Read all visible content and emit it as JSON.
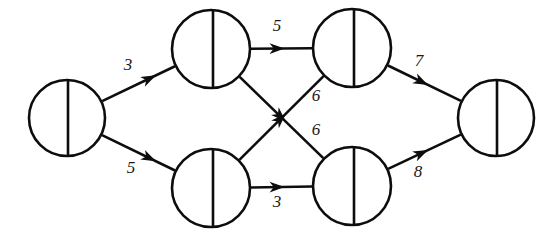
{
  "diagram": {
    "type": "flow-network",
    "title": "",
    "background_color": "#ffffff",
    "stroke_color": "#0d0d0d",
    "node_fill": "#ffffff",
    "node_style": "circle-with-vertical-divider",
    "nodes": [
      {
        "id": "source",
        "label": "",
        "cx": 67,
        "cy": 118,
        "r": 38,
        "divider_x": 68,
        "name": "node-source"
      },
      {
        "id": "a",
        "label": "",
        "cx": 211,
        "cy": 49,
        "r": 39,
        "divider_x": 213,
        "name": "node-top-left"
      },
      {
        "id": "b",
        "label": "",
        "cx": 211,
        "cy": 188,
        "r": 39,
        "divider_x": 213,
        "name": "node-bottom-left"
      },
      {
        "id": "c",
        "label": "",
        "cx": 352,
        "cy": 48,
        "r": 39,
        "divider_x": 354,
        "name": "node-top-right"
      },
      {
        "id": "d",
        "label": "",
        "cx": 352,
        "cy": 186,
        "r": 39,
        "divider_x": 354,
        "name": "node-bottom-right"
      },
      {
        "id": "sink",
        "label": "",
        "cx": 496,
        "cy": 118,
        "r": 38,
        "divider_x": 497,
        "name": "node-sink"
      }
    ],
    "edges": [
      {
        "id": "e1",
        "from": "source",
        "to": "a",
        "label": "3",
        "label_x": 128,
        "label_y": 66,
        "name": "edge-source-to-top-left"
      },
      {
        "id": "e2",
        "from": "source",
        "to": "b",
        "label": "5",
        "label_x": 131,
        "label_y": 169,
        "name": "edge-source-to-bottom-left"
      },
      {
        "id": "e3",
        "from": "a",
        "to": "c",
        "label": "5",
        "label_x": 277,
        "label_y": 27,
        "name": "edge-top-left-to-top-right"
      },
      {
        "id": "e4",
        "from": "a",
        "to": "d",
        "label": "6",
        "label_x": 316,
        "label_y": 131,
        "name": "edge-top-left-to-bottom-right"
      },
      {
        "id": "e5",
        "from": "b",
        "to": "c",
        "label": "6",
        "label_x": 316,
        "label_y": 97,
        "name": "edge-bottom-left-to-top-right"
      },
      {
        "id": "e6",
        "from": "b",
        "to": "d",
        "label": "3",
        "label_x": 277,
        "label_y": 203,
        "name": "edge-bottom-left-to-bottom-right"
      },
      {
        "id": "e7",
        "from": "c",
        "to": "sink",
        "label": "7",
        "label_x": 419,
        "label_y": 62,
        "name": "edge-top-right-to-sink"
      },
      {
        "id": "e8",
        "from": "d",
        "to": "sink",
        "label": "8",
        "label_x": 418,
        "label_y": 173,
        "name": "edge-bottom-right-to-sink"
      }
    ]
  }
}
